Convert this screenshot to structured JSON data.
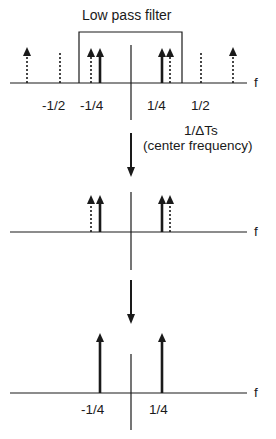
{
  "diagram": {
    "type": "signal-spectrum-diagram",
    "stages": [
      {
        "name": "sampled-spectrum",
        "filter_label": "Low pass filter",
        "axis_label": "f",
        "tick_labels": [
          "-1/2",
          "-1/4",
          "1/4",
          "1/2"
        ],
        "annotation_line1": "1/ΔTs",
        "annotation_line2": "(center frequency)"
      },
      {
        "name": "filtered-spectrum",
        "axis_label": "f"
      },
      {
        "name": "output-spectrum",
        "axis_label": "f",
        "tick_labels": [
          "-1/4",
          "1/4"
        ]
      }
    ],
    "colors": {
      "line": "#1a1a1a",
      "background": "#ffffff"
    }
  }
}
